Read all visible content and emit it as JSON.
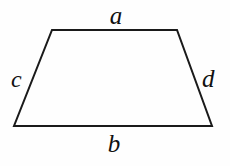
{
  "figure": {
    "kind": "trapezoid-diagram",
    "canvas": {
      "width": 230,
      "height": 166
    },
    "colors": {
      "background": "#fefefe",
      "stroke": "#1a1a1a",
      "fill": "none",
      "label_text": "#111111"
    },
    "stroke_width": 2,
    "vertices": {
      "top_left": {
        "x": 52,
        "y": 30
      },
      "top_right": {
        "x": 177,
        "y": 30
      },
      "bottom_right": {
        "x": 212,
        "y": 126
      },
      "bottom_left": {
        "x": 14,
        "y": 126
      }
    },
    "polygon_points": "52,30 177,30 212,126 14,126",
    "labels": {
      "top": "a",
      "bottom": "b",
      "left": "c",
      "right": "d"
    }
  }
}
